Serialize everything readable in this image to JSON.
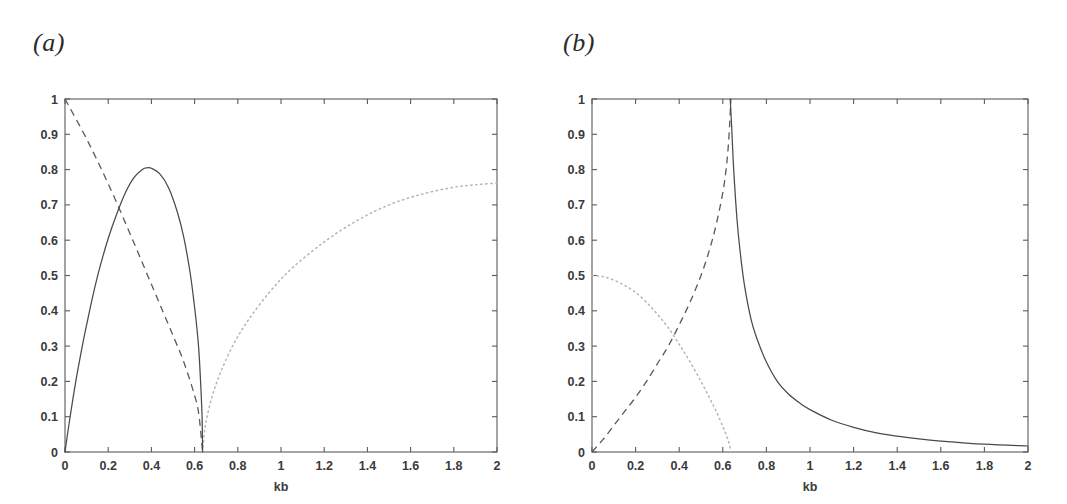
{
  "figure": {
    "panels": [
      {
        "label": "(a)",
        "label_x": 33,
        "label_y": 55,
        "plot_left": 65,
        "plot_right": 497,
        "plot_top": 99,
        "plot_bottom": 452
      },
      {
        "label": "(b)",
        "label_x": 563,
        "label_y": 55,
        "plot_left": 592,
        "plot_right": 1028,
        "plot_top": 99,
        "plot_bottom": 452
      }
    ],
    "xlabel": "kb",
    "x_ticks": [
      "0",
      "0.2",
      "0.4",
      "0.6",
      "0.8",
      "1",
      "1.2",
      "1.4",
      "1.6",
      "1.8",
      "2"
    ],
    "y_ticks": [
      "0",
      "0.1",
      "0.2",
      "0.3",
      "0.4",
      "0.5",
      "0.6",
      "0.7",
      "0.8",
      "0.9",
      "1"
    ],
    "colors": {
      "solid": "#4a4a4a",
      "dashed": "#5a5a5a",
      "dotted": "#b4b4b4",
      "axis": "#5a5a5a",
      "text": "#3a3a3a",
      "background": "#ffffff"
    }
  },
  "chart_data": [
    {
      "type": "line",
      "title": "(a)",
      "xlabel": "kb",
      "ylabel": "",
      "xlim": [
        0,
        2
      ],
      "ylim": [
        0,
        1
      ],
      "grid": false,
      "legend": "none",
      "x_ticks": [
        0,
        0.2,
        0.4,
        0.6,
        0.8,
        1,
        1.2,
        1.4,
        1.6,
        1.8,
        2
      ],
      "y_ticks": [
        0,
        0.1,
        0.2,
        0.3,
        0.4,
        0.5,
        0.6,
        0.7,
        0.8,
        0.9,
        1
      ],
      "cutoff_kb": 0.637,
      "series": [
        {
          "name": "solid-curve",
          "style": "solid",
          "x": [
            0,
            0.02,
            0.05,
            0.08,
            0.1,
            0.13,
            0.16,
            0.2,
            0.24,
            0.28,
            0.32,
            0.36,
            0.38,
            0.4,
            0.44,
            0.48,
            0.52,
            0.55,
            0.58,
            0.6,
            0.61,
            0.62,
            0.63,
            0.635,
            0.637
          ],
          "y": [
            0,
            0.085,
            0.2,
            0.3,
            0.36,
            0.445,
            0.52,
            0.605,
            0.675,
            0.735,
            0.778,
            0.801,
            0.805,
            0.804,
            0.787,
            0.748,
            0.68,
            0.608,
            0.505,
            0.41,
            0.355,
            0.285,
            0.17,
            0.09,
            0
          ]
        },
        {
          "name": "dashed-curve",
          "style": "dashed",
          "x": [
            0,
            0.1,
            0.2,
            0.3,
            0.4,
            0.5,
            0.55,
            0.6,
            0.62,
            0.637
          ],
          "y": [
            1.0,
            0.887,
            0.76,
            0.62,
            0.475,
            0.33,
            0.255,
            0.16,
            0.105,
            0
          ]
        },
        {
          "name": "dotted-curve",
          "style": "dotted",
          "x": [
            0.637,
            0.65,
            0.68,
            0.72,
            0.78,
            0.85,
            0.95,
            1.05,
            1.2,
            1.35,
            1.5,
            1.65,
            1.8,
            1.9,
            2.0
          ],
          "y": [
            0,
            0.075,
            0.155,
            0.225,
            0.305,
            0.375,
            0.455,
            0.52,
            0.595,
            0.655,
            0.7,
            0.73,
            0.75,
            0.757,
            0.762
          ]
        }
      ]
    },
    {
      "type": "line",
      "title": "(b)",
      "xlabel": "kb",
      "ylabel": "",
      "xlim": [
        0,
        2
      ],
      "ylim": [
        0,
        1
      ],
      "grid": false,
      "legend": "none",
      "x_ticks": [
        0,
        0.2,
        0.4,
        0.6,
        0.8,
        1,
        1.2,
        1.4,
        1.6,
        1.8,
        2
      ],
      "y_ticks": [
        0,
        0.1,
        0.2,
        0.3,
        0.4,
        0.5,
        0.6,
        0.7,
        0.8,
        0.9,
        1
      ],
      "resonance_kb": 0.637,
      "series": [
        {
          "name": "solid-curve",
          "style": "solid",
          "x": [
            0.634,
            0.64,
            0.65,
            0.665,
            0.68,
            0.7,
            0.73,
            0.76,
            0.8,
            0.85,
            0.9,
            0.95,
            1.0,
            1.1,
            1.2,
            1.3,
            1.4,
            1.5,
            1.6,
            1.8,
            2.0
          ],
          "y": [
            1.0,
            0.93,
            0.8,
            0.66,
            0.565,
            0.47,
            0.375,
            0.315,
            0.255,
            0.2,
            0.165,
            0.14,
            0.12,
            0.09,
            0.07,
            0.055,
            0.045,
            0.037,
            0.031,
            0.022,
            0.017
          ]
        },
        {
          "name": "dashed-curve",
          "style": "dashed",
          "x": [
            0,
            0.05,
            0.1,
            0.15,
            0.2,
            0.25,
            0.3,
            0.35,
            0.4,
            0.45,
            0.5,
            0.54,
            0.57,
            0.6,
            0.615,
            0.625,
            0.632,
            0.637
          ],
          "y": [
            0,
            0.035,
            0.075,
            0.115,
            0.155,
            0.2,
            0.25,
            0.3,
            0.36,
            0.425,
            0.5,
            0.575,
            0.645,
            0.735,
            0.8,
            0.865,
            0.935,
            1.0
          ]
        },
        {
          "name": "dotted-curve",
          "style": "dotted",
          "x": [
            0,
            0.05,
            0.1,
            0.15,
            0.2,
            0.25,
            0.3,
            0.35,
            0.4,
            0.45,
            0.5,
            0.54,
            0.57,
            0.6,
            0.62,
            0.63,
            0.637
          ],
          "y": [
            0.5,
            0.497,
            0.487,
            0.472,
            0.452,
            0.424,
            0.39,
            0.352,
            0.305,
            0.255,
            0.2,
            0.152,
            0.115,
            0.072,
            0.042,
            0.022,
            0
          ]
        }
      ]
    }
  ]
}
